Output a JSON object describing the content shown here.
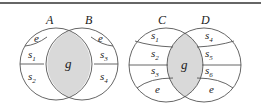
{
  "colors": {
    "intersection_fill": "#d9d9d9",
    "stroke": "#555555",
    "text": "#222222",
    "top_rule": "#666666"
  },
  "diagrams": [
    {
      "sets": [
        {
          "label": "A"
        },
        {
          "label": "B"
        }
      ],
      "intersection": {
        "label": "g"
      },
      "regions_left": [
        {
          "base": "e",
          "sub": ""
        },
        {
          "base": "s",
          "sub": "1"
        },
        {
          "base": "s",
          "sub": "2"
        }
      ],
      "regions_right": [
        {
          "base": "e",
          "sub": ""
        },
        {
          "base": "s",
          "sub": "3"
        },
        {
          "base": "s",
          "sub": "4"
        }
      ]
    },
    {
      "sets": [
        {
          "label": "C"
        },
        {
          "label": "D"
        }
      ],
      "intersection": {
        "label": "g"
      },
      "regions_left": [
        {
          "base": "s",
          "sub": "1"
        },
        {
          "base": "s",
          "sub": "2"
        },
        {
          "base": "s",
          "sub": "3"
        },
        {
          "base": "e",
          "sub": ""
        }
      ],
      "regions_right": [
        {
          "base": "s",
          "sub": "4"
        },
        {
          "base": "s",
          "sub": "5"
        },
        {
          "base": "s",
          "sub": "6"
        },
        {
          "base": "e",
          "sub": ""
        }
      ]
    }
  ]
}
